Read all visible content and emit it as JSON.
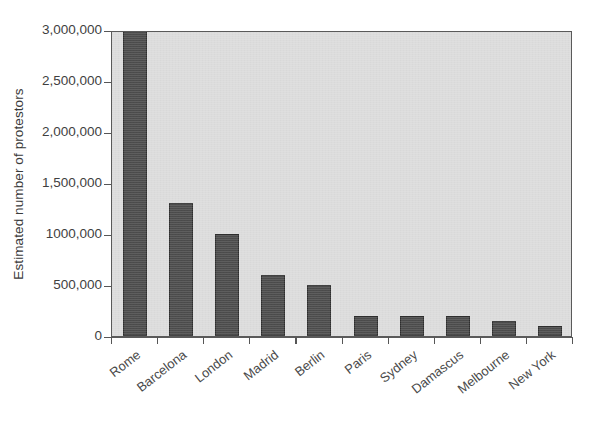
{
  "chart_data": {
    "type": "bar",
    "title": "",
    "subtitle": "",
    "xlabel": "",
    "ylabel": "Estimated number of protestors",
    "categories": [
      "Rome",
      "Barcelona",
      "London",
      "Madrid",
      "Berlin",
      "Paris",
      "Sydney",
      "Damascus",
      "Melbourne",
      "New York"
    ],
    "values": [
      3000000,
      1300000,
      1000000,
      600000,
      500000,
      200000,
      200000,
      200000,
      150000,
      100000
    ],
    "ylim": [
      0,
      3000000
    ],
    "yticks": [
      0,
      500000,
      1000000,
      1500000,
      2000000,
      2500000,
      3000000
    ],
    "ytick_labels": [
      "0",
      "500,000",
      "1000,000",
      "1,500,000",
      "2,000,000",
      "2,500,000",
      "3,000,000"
    ],
    "grid": false,
    "legend": null,
    "annotations": [],
    "colors": {
      "bar_fill": "#4c4c4c",
      "bar_edge": "#2e2e2e",
      "plot_background": "#dcdcdc",
      "figure_background": "#ffffff",
      "axis": "#5a5a5a",
      "tick_text": "#3f3f3f",
      "axis_label_text": "#3a3a3a"
    }
  }
}
